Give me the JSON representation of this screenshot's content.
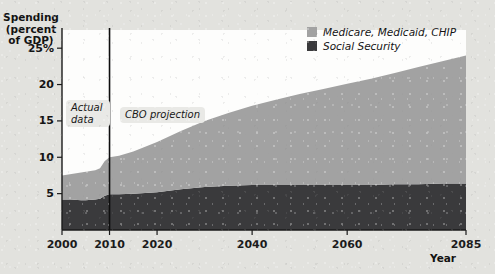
{
  "axes": {
    "y_title": "Spending (percent of GDP)",
    "y_title_lines": [
      "Spending",
      "(percent",
      "of GDP)"
    ],
    "x_title": "Year",
    "y_ticks": [
      "25%",
      "20",
      "15",
      "10",
      "5"
    ],
    "y_tick_values": [
      25,
      20,
      15,
      10,
      5
    ],
    "x_ticks": [
      "2000",
      "2010",
      "2020",
      "2040",
      "2060",
      "2085"
    ],
    "x_tick_values": [
      2000,
      2010,
      2020,
      2040,
      2060,
      2085
    ]
  },
  "legend": {
    "position": "top-right",
    "items": [
      {
        "label": "Medicare, Medicaid, CHIP",
        "color": "#a2a2a2"
      },
      {
        "label": "Social Security",
        "color": "#3a3a3c"
      }
    ]
  },
  "annotations": {
    "actual": {
      "text": "Actual data",
      "line1": "Actual",
      "line2": "data"
    },
    "projection": {
      "text": "CBO projection"
    },
    "divider_year": 2010
  },
  "colors": {
    "medicare": "#a2a2a2",
    "social_security": "#3a3a3c",
    "plot_background": "#fdfdfc",
    "page_background": "#e2e2de",
    "axis": "#1b1b1b",
    "annotation_background": "#e9e9e6"
  },
  "chart_data": {
    "type": "area",
    "title": "",
    "subtitle": "",
    "xlabel": "Year",
    "ylabel": "Spending (percent of GDP)",
    "xlim": [
      2000,
      2085
    ],
    "ylim": [
      0,
      27.5
    ],
    "grid": false,
    "stacked": true,
    "legend_position": "top-right",
    "x": [
      2000,
      2002,
      2004,
      2005,
      2007,
      2008,
      2009,
      2010,
      2012,
      2015,
      2020,
      2025,
      2030,
      2035,
      2040,
      2045,
      2050,
      2055,
      2060,
      2065,
      2070,
      2075,
      2080,
      2085
    ],
    "series": [
      {
        "name": "Social Security",
        "color": "#3a3a3c",
        "values": [
          4.2,
          4.2,
          4.1,
          4.1,
          4.2,
          4.3,
          4.7,
          4.9,
          4.9,
          5.0,
          5.2,
          5.6,
          5.9,
          6.1,
          6.2,
          6.2,
          6.2,
          6.2,
          6.2,
          6.2,
          6.3,
          6.3,
          6.4,
          6.4
        ]
      },
      {
        "name": "Medicare, Medicaid, CHIP",
        "color": "#a2a2a2",
        "values": [
          3.3,
          3.5,
          3.8,
          3.9,
          4.0,
          4.2,
          4.8,
          5.1,
          5.3,
          5.8,
          6.9,
          8.0,
          9.1,
          10.0,
          10.9,
          11.7,
          12.5,
          13.2,
          13.9,
          14.6,
          15.3,
          16.1,
          16.8,
          17.6
        ]
      }
    ],
    "totals": [
      7.5,
      7.7,
      7.9,
      8.0,
      8.2,
      8.5,
      9.5,
      10.0,
      10.2,
      10.8,
      12.1,
      13.6,
      15.0,
      16.1,
      17.1,
      17.9,
      18.7,
      19.4,
      20.1,
      20.8,
      21.6,
      22.4,
      23.2,
      24.0
    ],
    "annotations": [
      {
        "text": "Actual data",
        "x_range": [
          2000,
          2010
        ]
      },
      {
        "text": "CBO projection",
        "x_range": [
          2010,
          2085
        ]
      },
      {
        "type": "vline",
        "x": 2010
      }
    ]
  }
}
